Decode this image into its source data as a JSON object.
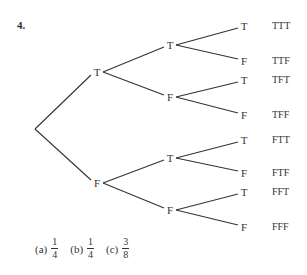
{
  "problem_number": "4.",
  "tree": {
    "root": {
      "x": 35,
      "y": 129
    },
    "level1": [
      {
        "label": "T",
        "x": 97,
        "y": 72
      },
      {
        "label": "F",
        "x": 97,
        "y": 183
      }
    ],
    "level2": [
      {
        "label": "T",
        "x": 170,
        "y": 45,
        "parent": 0
      },
      {
        "label": "F",
        "x": 170,
        "y": 97,
        "parent": 0
      },
      {
        "label": "T",
        "x": 170,
        "y": 158,
        "parent": 1
      },
      {
        "label": "F",
        "x": 170,
        "y": 210,
        "parent": 1
      }
    ],
    "leaves": [
      {
        "label": "T",
        "x": 244,
        "y": 26,
        "parent": 0,
        "outcome": "TTT"
      },
      {
        "label": "F",
        "x": 244,
        "y": 61,
        "parent": 0,
        "outcome": "TTF"
      },
      {
        "label": "T",
        "x": 244,
        "y": 80,
        "parent": 1,
        "outcome": "TFT"
      },
      {
        "label": "F",
        "x": 244,
        "y": 115,
        "parent": 1,
        "outcome": "TFF"
      },
      {
        "label": "T",
        "x": 244,
        "y": 140,
        "parent": 2,
        "outcome": "FTT"
      },
      {
        "label": "F",
        "x": 244,
        "y": 173,
        "parent": 2,
        "outcome": "FTF"
      },
      {
        "label": "T",
        "x": 244,
        "y": 192,
        "parent": 3,
        "outcome": "FFT"
      },
      {
        "label": "F",
        "x": 244,
        "y": 227,
        "parent": 3,
        "outcome": "FFF"
      }
    ]
  },
  "answers": [
    {
      "label": "(a)",
      "num": "1",
      "den": "4"
    },
    {
      "label": "(b)",
      "num": "1",
      "den": "4"
    },
    {
      "label": "(c)",
      "num": "3",
      "den": "8"
    }
  ]
}
